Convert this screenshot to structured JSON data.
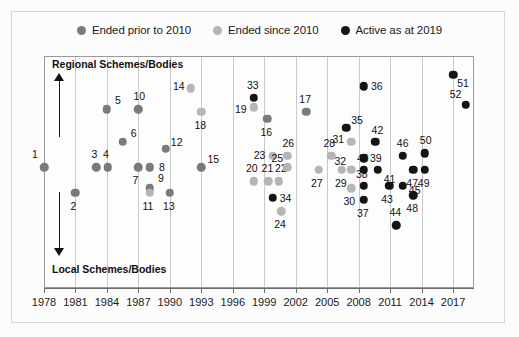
{
  "legend": {
    "items": [
      {
        "label": "Ended prior to 2010",
        "color": "#7a7a7a",
        "key": "ended_prior_2010"
      },
      {
        "label": "Ended since 2010",
        "color": "#b5b5b5",
        "key": "ended_since_2010"
      },
      {
        "label": "Active as at 2019",
        "color": "#141414",
        "key": "active_2019"
      }
    ]
  },
  "axis_notes": {
    "top": "Regional Schemes/Bodies",
    "bottom": "Local Schemes/Bodies"
  },
  "chart_data": {
    "type": "scatter",
    "title": "",
    "xlabel": "",
    "ylabel": "",
    "xlim": [
      1978,
      2019
    ],
    "ylim": [
      0,
      100
    ],
    "grid": true,
    "legend_position": "top-center",
    "xticks": [
      1978,
      1981,
      1984,
      1987,
      1990,
      1993,
      1996,
      1999,
      2002,
      2005,
      2008,
      2011,
      2014,
      2017
    ],
    "y_axis_annotation_top": "Regional Schemes/Bodies",
    "y_axis_annotation_bottom": "Local Schemes/Bodies",
    "series": [
      {
        "name": "Ended prior to 2010",
        "color": "#7a7a7a"
      },
      {
        "name": "Ended since 2010",
        "color": "#b5b5b5"
      },
      {
        "name": "Active as at 2019",
        "color": "#141414"
      }
    ],
    "points": [
      {
        "id": "1",
        "x": 1978.0,
        "y": 52,
        "series": "Ended prior to 2010",
        "lx": -9,
        "ly": -13
      },
      {
        "id": "2",
        "x": 1981.0,
        "y": 41,
        "series": "Ended prior to 2010",
        "lx": -2,
        "ly": 13
      },
      {
        "id": "3",
        "x": 1983.0,
        "y": 52,
        "series": "Ended prior to 2010",
        "lx": -2,
        "ly": -13
      },
      {
        "id": "4",
        "x": 1984.1,
        "y": 52,
        "series": "Ended prior to 2010",
        "lx": -2,
        "ly": -13
      },
      {
        "id": "5",
        "x": 1984.0,
        "y": 77,
        "series": "Ended prior to 2010",
        "lx": 11,
        "ly": -9
      },
      {
        "id": "6",
        "x": 1985.5,
        "y": 63,
        "series": "Ended prior to 2010",
        "lx": 11,
        "ly": -9
      },
      {
        "id": "7",
        "x": 1987.0,
        "y": 52,
        "series": "Ended prior to 2010",
        "lx": -3,
        "ly": 13
      },
      {
        "id": "8",
        "x": 1988.1,
        "y": 52,
        "series": "Ended prior to 2010",
        "lx": 12,
        "ly": 0
      },
      {
        "id": "9",
        "x": 1988.1,
        "y": 43,
        "series": "Ended prior to 2010",
        "lx": 11,
        "ly": -10
      },
      {
        "id": "10",
        "x": 1987.0,
        "y": 77,
        "series": "Ended prior to 2010",
        "lx": 1,
        "ly": -13
      },
      {
        "id": "11",
        "x": 1988.1,
        "y": 41,
        "series": "Ended since 2010",
        "lx": -2,
        "ly": 13
      },
      {
        "id": "12",
        "x": 1989.6,
        "y": 60,
        "series": "Ended prior to 2010",
        "lx": 11,
        "ly": -7
      },
      {
        "id": "13",
        "x": 1990.0,
        "y": 41,
        "series": "Ended prior to 2010",
        "lx": -1,
        "ly": 13
      },
      {
        "id": "14",
        "x": 1992.0,
        "y": 86,
        "series": "Ended since 2010",
        "lx": -12,
        "ly": -2
      },
      {
        "id": "15",
        "x": 1993.0,
        "y": 52,
        "series": "Ended prior to 2010",
        "lx": 12,
        "ly": -8
      },
      {
        "id": "16",
        "x": 1999.3,
        "y": 73,
        "series": "Ended prior to 2010",
        "lx": -1,
        "ly": 13
      },
      {
        "id": "17",
        "x": 2003.0,
        "y": 76,
        "series": "Ended prior to 2010",
        "lx": -1,
        "ly": -13
      },
      {
        "id": "18",
        "x": 1993.0,
        "y": 76,
        "series": "Ended since 2010",
        "lx": -1,
        "ly": 13
      },
      {
        "id": "19",
        "x": 1998.0,
        "y": 78,
        "series": "Ended since 2010",
        "lx": -13,
        "ly": 2
      },
      {
        "id": "20",
        "x": 1998.0,
        "y": 46,
        "series": "Ended since 2010",
        "lx": -2,
        "ly": -13
      },
      {
        "id": "21",
        "x": 1999.4,
        "y": 46,
        "series": "Ended since 2010",
        "lx": -1,
        "ly": -13
      },
      {
        "id": "22",
        "x": 2000.4,
        "y": 46,
        "series": "Ended since 2010",
        "lx": 2,
        "ly": -13
      },
      {
        "id": "23",
        "x": 1999.8,
        "y": 57,
        "series": "Ended since 2010",
        "lx": -13,
        "ly": -1
      },
      {
        "id": "24",
        "x": 2000.6,
        "y": 33,
        "series": "Ended since 2010",
        "lx": -1,
        "ly": 13
      },
      {
        "id": "25",
        "x": 2001.2,
        "y": 52,
        "series": "Ended since 2010",
        "lx": -10,
        "ly": -9
      },
      {
        "id": "26",
        "x": 2001.2,
        "y": 57,
        "series": "Ended since 2010",
        "lx": 1,
        "ly": -13
      },
      {
        "id": "27",
        "x": 2004.2,
        "y": 51,
        "series": "Ended since 2010",
        "lx": -2,
        "ly": 13
      },
      {
        "id": "28",
        "x": 2005.4,
        "y": 57,
        "series": "Ended since 2010",
        "lx": -2,
        "ly": -13
      },
      {
        "id": "29",
        "x": 2006.4,
        "y": 51,
        "series": "Ended since 2010",
        "lx": -1,
        "ly": 13
      },
      {
        "id": "30",
        "x": 2007.3,
        "y": 43,
        "series": "Ended since 2010",
        "lx": -2,
        "ly": 13
      },
      {
        "id": "31",
        "x": 2007.3,
        "y": 63,
        "series": "Ended since 2010",
        "lx": -13,
        "ly": -3
      },
      {
        "id": "32",
        "x": 2007.3,
        "y": 51,
        "series": "Ended since 2010",
        "lx": -11,
        "ly": -9
      },
      {
        "id": "33",
        "x": 1998.0,
        "y": 82,
        "series": "Active as at 2019",
        "lx": -1,
        "ly": -13
      },
      {
        "id": "34",
        "x": 1999.8,
        "y": 39,
        "series": "Active as at 2019",
        "lx": 13,
        "ly": 0
      },
      {
        "id": "35",
        "x": 2006.8,
        "y": 69,
        "series": "Active as at 2019",
        "lx": 11,
        "ly": -8
      },
      {
        "id": "36",
        "x": 2008.5,
        "y": 87,
        "series": "Active as at 2019",
        "lx": 13,
        "ly": 0
      },
      {
        "id": "37",
        "x": 2008.5,
        "y": 38,
        "series": "Active as at 2019",
        "lx": -1,
        "ly": 13
      },
      {
        "id": "38",
        "x": 2008.5,
        "y": 44,
        "series": "Active as at 2019",
        "lx": -2,
        "ly": -12
      },
      {
        "id": "39",
        "x": 2008.5,
        "y": 56,
        "series": "Active as at 2019",
        "lx": 12,
        "ly": 0
      },
      {
        "id": "40",
        "x": 2008.5,
        "y": 51,
        "series": "Active as at 2019",
        "lx": -1,
        "ly": -12
      },
      {
        "id": "41",
        "x": 2009.8,
        "y": 51,
        "series": "Active as at 2019",
        "lx": 12,
        "ly": 9
      },
      {
        "id": "42",
        "x": 2009.6,
        "y": 63,
        "series": "Active as at 2019",
        "lx": 2,
        "ly": -12
      },
      {
        "id": "43",
        "x": 2010.9,
        "y": 44,
        "series": "Active as at 2019",
        "lx": -2,
        "ly": 13
      },
      {
        "id": "44",
        "x": 2011.6,
        "y": 27,
        "series": "Active as at 2019",
        "lx": -1,
        "ly": -13
      },
      {
        "id": "45",
        "x": 2012.2,
        "y": 44,
        "series": "Active as at 2019",
        "lx": 12,
        "ly": 4
      },
      {
        "id": "46",
        "x": 2012.2,
        "y": 57,
        "series": "Active as at 2019",
        "lx": 0,
        "ly": -13
      },
      {
        "id": "47",
        "x": 2013.2,
        "y": 51,
        "series": "Active as at 2019",
        "lx": -1,
        "ly": 13
      },
      {
        "id": "48",
        "x": 2013.2,
        "y": 40,
        "series": "Active as at 2019",
        "lx": -1,
        "ly": 13
      },
      {
        "id": "49",
        "x": 2014.3,
        "y": 51,
        "series": "Active as at 2019",
        "lx": -1,
        "ly": 13
      },
      {
        "id": "50",
        "x": 2014.3,
        "y": 58,
        "series": "Active as at 2019",
        "lx": 1,
        "ly": -13
      },
      {
        "id": "51",
        "x": 2017.0,
        "y": 92,
        "series": "Active as at 2019",
        "lx": 10,
        "ly": 8
      },
      {
        "id": "52",
        "x": 2018.2,
        "y": 79,
        "series": "Active as at 2019",
        "lx": -10,
        "ly": -11
      }
    ]
  }
}
